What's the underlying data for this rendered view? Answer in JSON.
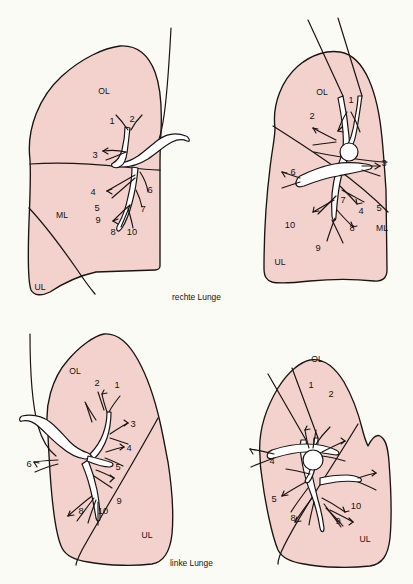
{
  "figure": {
    "background_color": "#fbfbf6",
    "lung_fill_color": "#f3d2cd",
    "outline_color": "#1a1512",
    "bronchus_fill_color": "#ffffff"
  },
  "captions": {
    "right_lung": "rechte Lunge",
    "left_lung": "linke Lunge"
  },
  "lobe_labels": {
    "upper": "OL",
    "middle": "ML",
    "lower": "UL"
  },
  "segment_numbers": [
    "1",
    "2",
    "3",
    "4",
    "5",
    "6",
    "7",
    "8",
    "9",
    "10"
  ],
  "panels": [
    {
      "id": "right-lung-lateral",
      "position": "top-left",
      "lung": "rechte Lunge",
      "view": "lateral",
      "lobes": [
        {
          "abbr": "OL",
          "x": 104,
          "y": 92
        },
        {
          "abbr": "ML",
          "x": 62,
          "y": 216
        },
        {
          "abbr": "UL",
          "x": 39,
          "y": 288
        }
      ],
      "segments": [
        {
          "n": "1",
          "x": 112,
          "y": 124
        },
        {
          "n": "2",
          "x": 132,
          "y": 122
        },
        {
          "n": "3",
          "x": 95,
          "y": 158
        },
        {
          "n": "4",
          "x": 93,
          "y": 192
        },
        {
          "n": "5",
          "x": 97,
          "y": 208
        },
        {
          "n": "6",
          "x": 148,
          "y": 190
        },
        {
          "n": "7",
          "x": 142,
          "y": 210
        },
        {
          "n": "8",
          "x": 113,
          "y": 232
        },
        {
          "n": "9",
          "x": 98,
          "y": 220
        },
        {
          "n": "10",
          "x": 131,
          "y": 232
        }
      ],
      "has_hilum_circle": false,
      "trachea_lines": 1
    },
    {
      "id": "right-lung-medial",
      "position": "top-right",
      "lung": "rechte Lunge",
      "view": "medial",
      "lobes": [
        {
          "abbr": "OL",
          "x": 320,
          "y": 92
        },
        {
          "abbr": "ML",
          "x": 382,
          "y": 228
        },
        {
          "abbr": "UL",
          "x": 277,
          "y": 262
        }
      ],
      "segments": [
        {
          "n": "1",
          "x": 351,
          "y": 100
        },
        {
          "n": "2",
          "x": 312,
          "y": 116
        },
        {
          "n": "3",
          "x": 372,
          "y": 163
        },
        {
          "n": "4",
          "x": 361,
          "y": 211
        },
        {
          "n": "5",
          "x": 378,
          "y": 208
        },
        {
          "n": "6",
          "x": 293,
          "y": 172
        },
        {
          "n": "7",
          "x": 342,
          "y": 200
        },
        {
          "n": "8",
          "x": 351,
          "y": 228
        },
        {
          "n": "9",
          "x": 316,
          "y": 248
        },
        {
          "n": "10",
          "x": 287,
          "y": 226
        }
      ],
      "has_hilum_circle": true,
      "trachea_lines": 2
    },
    {
      "id": "left-lung-lateral",
      "position": "bottom-left",
      "lung": "linke Lunge",
      "view": "lateral",
      "lobes": [
        {
          "abbr": "OL",
          "x": 74,
          "y": 370
        },
        {
          "abbr": "UL",
          "x": 146,
          "y": 535
        }
      ],
      "segments": [
        {
          "n": "1",
          "x": 117,
          "y": 385
        },
        {
          "n": "2",
          "x": 97,
          "y": 384
        },
        {
          "n": "3",
          "x": 121,
          "y": 424
        },
        {
          "n": "4",
          "x": 117,
          "y": 447
        },
        {
          "n": "5",
          "x": 111,
          "y": 467
        },
        {
          "n": "6",
          "x": 62,
          "y": 464
        },
        {
          "n": "8",
          "x": 82,
          "y": 510
        },
        {
          "n": "9",
          "x": 118,
          "y": 501
        },
        {
          "n": "10",
          "x": 104,
          "y": 511
        }
      ],
      "has_hilum_circle": false,
      "trachea_lines": 1
    },
    {
      "id": "left-lung-medial",
      "position": "bottom-right",
      "lung": "linke Lunge",
      "view": "medial",
      "lobes": [
        {
          "abbr": "OL",
          "x": 316,
          "y": 360
        },
        {
          "abbr": "UL",
          "x": 365,
          "y": 540
        }
      ],
      "segments": [
        {
          "n": "1",
          "x": 310,
          "y": 385
        },
        {
          "n": "2",
          "x": 330,
          "y": 395
        },
        {
          "n": "4",
          "x": 271,
          "y": 462
        },
        {
          "n": "5",
          "x": 273,
          "y": 500
        },
        {
          "n": "8",
          "x": 292,
          "y": 519
        },
        {
          "n": "9",
          "x": 337,
          "y": 522
        },
        {
          "n": "10",
          "x": 355,
          "y": 507
        }
      ],
      "has_hilum_circle": true,
      "trachea_lines": 2
    }
  ]
}
